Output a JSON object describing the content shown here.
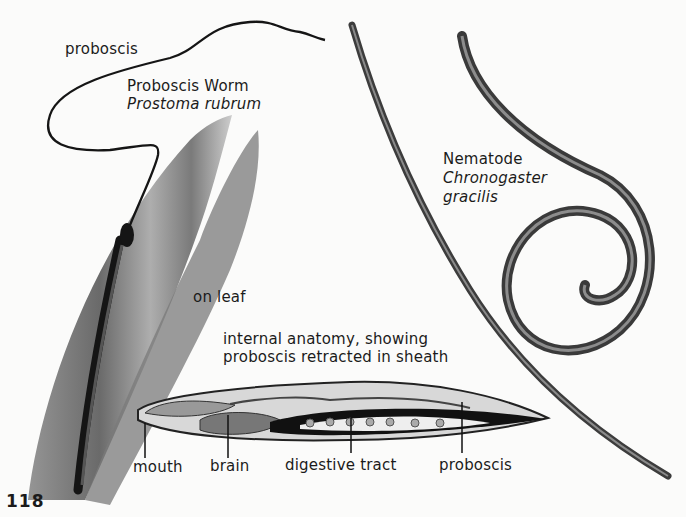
{
  "page": {
    "page_number": "118"
  },
  "proboscis_worm": {
    "common_name": "Proboscis Worm",
    "scientific_name": "Prostoma rubrum",
    "label_proboscis": "proboscis",
    "label_habitat": "on leaf"
  },
  "anatomy": {
    "caption_line1": "internal anatomy, showing",
    "caption_line2": "proboscis retracted in sheath",
    "labels": [
      "mouth",
      "brain",
      "digestive tract",
      "proboscis"
    ]
  },
  "nematode": {
    "common_name": "Nematode",
    "genus": "Chronogaster",
    "species": "gracilis"
  }
}
